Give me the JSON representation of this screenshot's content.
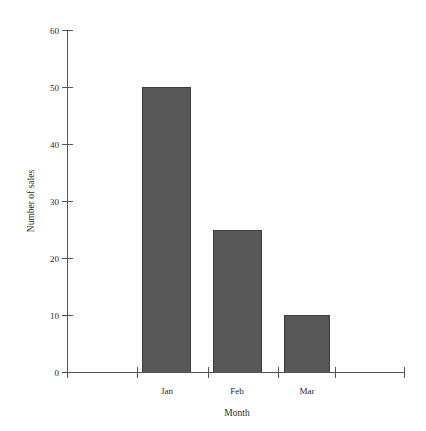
{
  "chart_data": {
    "type": "bar",
    "title": "",
    "subtitle": "",
    "categories": [
      "Jan",
      "Feb",
      "Mar"
    ],
    "values": [
      50,
      25,
      10
    ],
    "xlabel": "Month",
    "ylabel": "Number of sales",
    "ylim": [
      0,
      60
    ],
    "yticks": [
      0,
      10,
      20,
      30,
      40,
      50,
      60
    ],
    "ytick_labels": [
      "0",
      "10",
      "20",
      "30",
      "40",
      "50",
      "60"
    ],
    "grid": false,
    "legend": false,
    "legend_position": "none",
    "bar_color": "#585858",
    "bar_edge_color": "#3d3d3d",
    "axis_color": "#555555",
    "background_color": "#ffffff",
    "series": [
      {
        "name": "Number of sales",
        "values": [
          50,
          25,
          10
        ]
      }
    ],
    "annotations": []
  },
  "axes": {
    "y_ticks": [
      {
        "label": "60",
        "value": 60
      },
      {
        "label": "50",
        "value": 50
      },
      {
        "label": "40",
        "value": 40
      },
      {
        "label": "30",
        "value": 30
      },
      {
        "label": "20",
        "value": 20
      },
      {
        "label": "10",
        "value": 10
      },
      {
        "label": "0",
        "value": 0
      }
    ],
    "x_ticks": [
      {
        "label": "Jan"
      },
      {
        "label": "Feb"
      },
      {
        "label": "Mar"
      }
    ],
    "x_title": "Month",
    "y_title": "Number of sales"
  }
}
